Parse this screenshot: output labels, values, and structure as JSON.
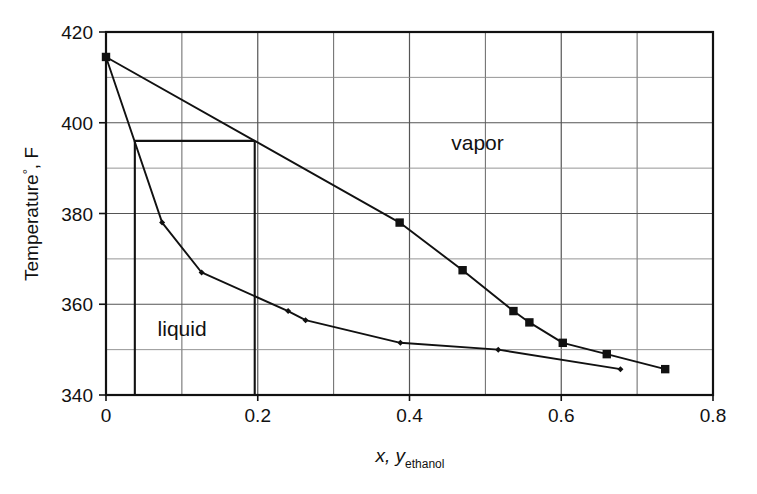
{
  "chart_data": {
    "type": "line",
    "title": "",
    "subtitle": "",
    "xlabel": "x, y",
    "xlabel_sub": "ethanol",
    "ylabel": "Temperature",
    "ylabel_degree": "°",
    "ylabel_unit": ", F",
    "xlim": [
      0,
      0.8
    ],
    "ylim": [
      340,
      420
    ],
    "xticks": [
      0,
      0.2,
      0.4,
      0.6,
      0.8
    ],
    "xtick_labels": [
      "0",
      "0.2",
      "0.4",
      "0.6",
      "0.8"
    ],
    "yticks": [
      340,
      360,
      380,
      400,
      420
    ],
    "ytick_labels": [
      "340",
      "360",
      "380",
      "400",
      "420"
    ],
    "grid": true,
    "grid_x_step": 0.1,
    "grid_y_step": 10,
    "legend": "none",
    "series": [
      {
        "name": "vapor (dew point curve)",
        "marker": "square",
        "color": "#111111",
        "points": [
          {
            "x": 0.0,
            "y": 414.5
          },
          {
            "x": 0.387,
            "y": 378.0
          },
          {
            "x": 0.47,
            "y": 367.5
          },
          {
            "x": 0.537,
            "y": 358.5
          },
          {
            "x": 0.558,
            "y": 356.0
          },
          {
            "x": 0.602,
            "y": 351.5
          },
          {
            "x": 0.66,
            "y": 349.0
          },
          {
            "x": 0.737,
            "y": 345.7
          }
        ]
      },
      {
        "name": "liquid (bubble point curve)",
        "marker": "diamond",
        "color": "#111111",
        "points": [
          {
            "x": 0.0,
            "y": 414.5
          },
          {
            "x": 0.074,
            "y": 378.0
          },
          {
            "x": 0.126,
            "y": 367.0
          },
          {
            "x": 0.24,
            "y": 358.5
          },
          {
            "x": 0.263,
            "y": 356.5
          },
          {
            "x": 0.388,
            "y": 351.5
          },
          {
            "x": 0.517,
            "y": 350.0
          },
          {
            "x": 0.678,
            "y": 345.7
          }
        ]
      }
    ],
    "annotations": [
      {
        "name": "vapor-region-label",
        "text": "vapor",
        "x": 0.455,
        "y": 394.0
      },
      {
        "name": "liquid-region-label",
        "text": "liquid",
        "x": 0.068,
        "y": 353.0
      }
    ],
    "construction_lines": {
      "name": "tie-line-construction",
      "tie_line_temperature": 396.0,
      "liquid_composition": 0.038,
      "vapor_composition": 0.196,
      "baseline_temperature": 340
    }
  }
}
